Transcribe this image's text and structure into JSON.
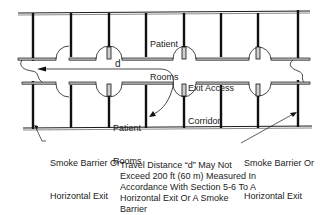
{
  "diagram": {
    "labels": {
      "patient_rooms_top": [
        "Patient",
        "Rooms"
      ],
      "patient_rooms_bottom": [
        "Patient",
        "Rooms"
      ],
      "distance_marker": "d",
      "corridor": [
        "Exit Access",
        "Corridor"
      ],
      "smoke_barrier_left": [
        "Smoke Barrier Or",
        "Horizontal Exit"
      ],
      "smoke_barrier_right": [
        "Smoke Barrier Or",
        "Horizontal Exit"
      ]
    },
    "note": [
      "Travel Distance “d” May Not",
      "Exceed 200 ft (60 m) Measured In",
      "Accordance With Section 5-6 To A",
      "Horizontal Exit Or A Smoke",
      "Barrier"
    ],
    "colors": {
      "line": "#1a1a1a",
      "wall_fill": "#9a9a9a"
    }
  }
}
